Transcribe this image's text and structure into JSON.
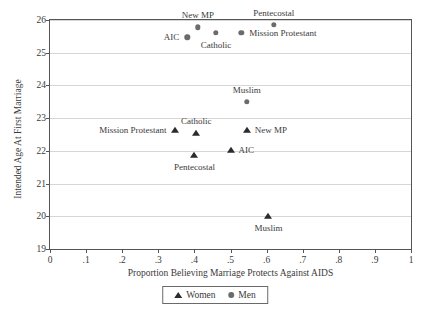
{
  "chart_data": {
    "type": "scatter",
    "title": "",
    "xlabel": "Proportion Believing Marriage Protects Against AIDS",
    "ylabel": "Intended Age At First Marriage",
    "xlim": [
      0,
      1
    ],
    "ylim": [
      19,
      26
    ],
    "grid": true,
    "legend_position": "bottom-center",
    "xticks": [
      "0",
      ".1",
      ".2",
      ".3",
      ".4",
      ".5",
      ".6",
      ".7",
      ".8",
      ".9",
      "1"
    ],
    "xtick_values": [
      0,
      0.1,
      0.2,
      0.3,
      0.4,
      0.5,
      0.6,
      0.7,
      0.8,
      0.9,
      1
    ],
    "yticks": [
      "19",
      "20",
      "21",
      "22",
      "23",
      "24",
      "25",
      "26"
    ],
    "ytick_values": [
      19,
      20,
      21,
      22,
      23,
      24,
      25,
      26
    ],
    "series": [
      {
        "name": "Women",
        "marker": "triangle",
        "color": "#2b2b2b",
        "points": [
          {
            "label": "Mission Protestant",
            "x": 0.345,
            "y": 22.65,
            "label_pos": "left"
          },
          {
            "label": "Catholic",
            "x": 0.405,
            "y": 22.55,
            "label_pos": "above"
          },
          {
            "label": "Pentecostal",
            "x": 0.4,
            "y": 21.88,
            "label_pos": "below"
          },
          {
            "label": "AIC",
            "x": 0.5,
            "y": 22.03,
            "label_pos": "right"
          },
          {
            "label": "New MP",
            "x": 0.545,
            "y": 22.65,
            "label_pos": "right"
          },
          {
            "label": "Muslim",
            "x": 0.605,
            "y": 20.0,
            "label_pos": "below"
          }
        ]
      },
      {
        "name": "Men",
        "marker": "circle",
        "color": "#6b6b6b",
        "points": [
          {
            "label": "AIC",
            "x": 0.38,
            "y": 25.47,
            "label_pos": "left"
          },
          {
            "label": "New MP",
            "x": 0.41,
            "y": 25.78,
            "label_pos": "above"
          },
          {
            "label": "Catholic",
            "x": 0.46,
            "y": 25.6,
            "label_pos": "below"
          },
          {
            "label": "Mission Protestant",
            "x": 0.53,
            "y": 25.6,
            "label_pos": "right"
          },
          {
            "label": "Pentecostal",
            "x": 0.62,
            "y": 25.85,
            "label_pos": "above"
          },
          {
            "label": "Muslim",
            "x": 0.545,
            "y": 23.5,
            "label_pos": "above"
          }
        ]
      }
    ]
  },
  "legend": {
    "items": [
      {
        "label": "Women",
        "marker": "triangle"
      },
      {
        "label": "Men",
        "marker": "circle"
      }
    ]
  },
  "colors": {
    "women_marker": "#2b2b2b",
    "men_marker": "#6b6b6b",
    "gridline": "#d6d6d6",
    "frame": "#555555",
    "text": "#3a3a3a",
    "background": "#ffffff"
  }
}
